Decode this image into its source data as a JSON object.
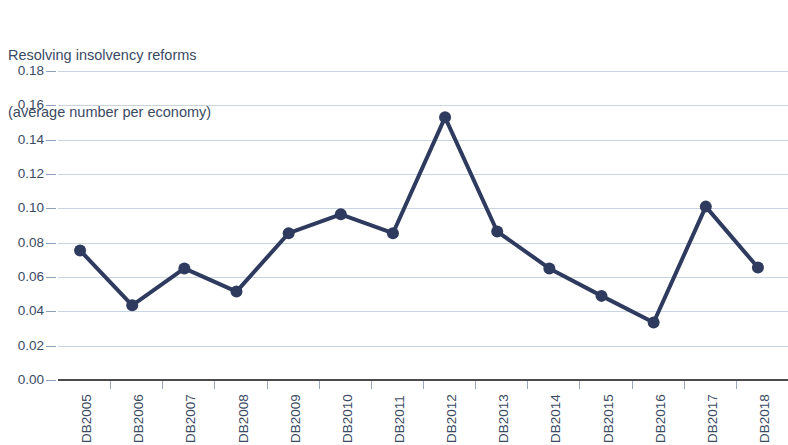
{
  "chart_data": {
    "type": "line",
    "title": "Resolving insolvency reforms",
    "subtitle": "(average number per economy)",
    "title_lines": [
      "Resolving insolvency reforms",
      "(average number per economy)"
    ],
    "xlabel": "",
    "ylabel": "",
    "categories": [
      "DB2005",
      "DB2006",
      "DB2007",
      "DB2008",
      "DB2009",
      "DB2010",
      "DB2011",
      "DB2012",
      "DB2013",
      "DB2014",
      "DB2015",
      "DB2016",
      "DB2017",
      "DB2018"
    ],
    "values": [
      0.0755,
      0.0435,
      0.065,
      0.0515,
      0.0855,
      0.0965,
      0.0855,
      0.153,
      0.0865,
      0.065,
      0.049,
      0.0335,
      0.101,
      0.0655
    ],
    "ylim": [
      0.0,
      0.18
    ],
    "ytick_values": [
      0.0,
      0.02,
      0.04,
      0.06,
      0.08,
      0.1,
      0.12,
      0.14,
      0.16,
      0.18
    ],
    "ytick_labels": [
      "0.00",
      "0.02",
      "0.04",
      "0.06",
      "0.08",
      "0.10",
      "0.12",
      "0.14",
      "0.16",
      "0.18"
    ],
    "grid": true,
    "legend": false,
    "legend_position": "none",
    "series_color": "#2e3b5e",
    "grid_color": "#c9d4e3",
    "text_color": "#3b4a63",
    "axis_color": "#4b4b4b",
    "marker": "circle",
    "marker_size": 9,
    "line_width": 4
  }
}
